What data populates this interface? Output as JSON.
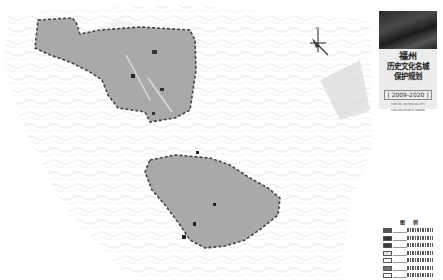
{
  "map": {
    "background_color": "#ffffff",
    "contour_color": "#d9d9d9",
    "district_fill": "#a9a9a9",
    "district_border": "#444444",
    "districts": [
      {
        "name": "north-district"
      },
      {
        "name": "south-district"
      }
    ],
    "compass": {
      "label": "N"
    }
  },
  "panel": {
    "title_city": "福州",
    "title_line1": "历史文化名城",
    "title_line2": "保护规划",
    "title_years": "[ 2009-2020 ]",
    "subtitle_en_1": "FUZHOU HISTORICAL CITY",
    "subtitle_en_2": "CONSERVATION PLANNING",
    "legend_title": "图 例",
    "legend_items": [
      {
        "swatch_color": "#555555"
      },
      {
        "swatch_color": "#333333"
      },
      {
        "swatch_color": "#3a3a3a"
      },
      {
        "swatch_color": "#e6e6e6"
      },
      {
        "swatch_color": "#ffffff"
      },
      {
        "swatch_color": "#777777"
      },
      {
        "swatch_color": "#f5f5f5"
      }
    ]
  }
}
